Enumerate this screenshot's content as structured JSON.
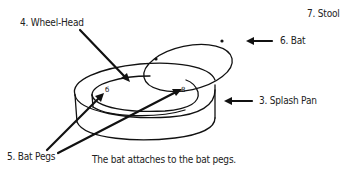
{
  "diagram": {
    "type": "labeled-illustration",
    "labels": {
      "stool": "7. Stool",
      "wheel_head": "4. Wheel-Head",
      "bat": "6. Bat",
      "splash_pan": "3. Splash Pan",
      "bat_pegs": "5. Bat Pegs"
    },
    "caption": "The bat attaches to the bat pegs.",
    "colors": {
      "ink": "#111111",
      "background": "#ffffff"
    }
  }
}
